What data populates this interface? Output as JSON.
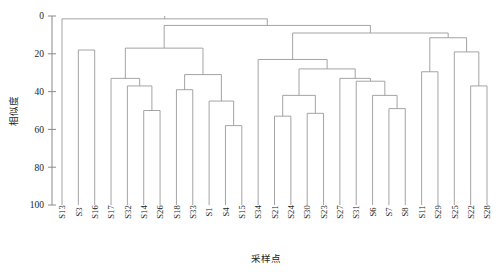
{
  "chart_data": {
    "type": "dendrogram",
    "title": "",
    "xlabel": "采样点",
    "ylabel": "相似度",
    "ylim": [
      0,
      100
    ],
    "y_inverted": true,
    "grid": false,
    "legend": "none",
    "yticks": [
      0,
      20,
      40,
      60,
      80,
      100
    ],
    "ytick_labels": [
      "0",
      "20",
      "40",
      "60",
      "80",
      "100"
    ],
    "leaves": [
      "S13",
      "S3",
      "S16",
      "S17",
      "S32",
      "S14",
      "S26",
      "S18",
      "S33",
      "S1",
      "S4",
      "S15",
      "S34",
      "S21",
      "S24",
      "S30",
      "S23",
      "S27",
      "S31",
      "S6",
      "S7",
      "S8",
      "S11",
      "S29",
      "S25",
      "S22",
      "S28"
    ],
    "leaf_count": 27,
    "merges": [
      {
        "id": "m1",
        "left": "S3",
        "right": "S16",
        "height": 18.0
      },
      {
        "id": "m2",
        "left": "S14",
        "right": "S26",
        "height": 50.0
      },
      {
        "id": "m3",
        "left": "S32",
        "right": "m2",
        "height": 37.0
      },
      {
        "id": "m4",
        "left": "S17",
        "right": "m3",
        "height": 33.0
      },
      {
        "id": "m5",
        "left": "S4",
        "right": "S15",
        "height": 58.0
      },
      {
        "id": "m6",
        "left": "S1",
        "right": "m5",
        "height": 45.0
      },
      {
        "id": "m7",
        "left": "S18",
        "right": "S33",
        "height": 39.0
      },
      {
        "id": "m8",
        "left": "m7",
        "right": "m6",
        "height": 31.0
      },
      {
        "id": "m9",
        "left": "m4",
        "right": "m8",
        "height": 17.0
      },
      {
        "id": "m10",
        "left": "S21",
        "right": "S24",
        "height": 53.0
      },
      {
        "id": "m11",
        "left": "S30",
        "right": "S23",
        "height": 51.5
      },
      {
        "id": "m12",
        "left": "m10",
        "right": "m11",
        "height": 42.0
      },
      {
        "id": "m13",
        "left": "S7",
        "right": "S8",
        "height": 49.0
      },
      {
        "id": "m14",
        "left": "S6",
        "right": "m13",
        "height": 42.0
      },
      {
        "id": "m15",
        "left": "S31",
        "right": "m14",
        "height": 34.5
      },
      {
        "id": "m16",
        "left": "S27",
        "right": "m15",
        "height": 33.0
      },
      {
        "id": "m17",
        "left": "m12",
        "right": "m16",
        "height": 28.0
      },
      {
        "id": "m18",
        "left": "S34",
        "right": "m17",
        "height": 23.0
      },
      {
        "id": "m19",
        "left": "S11",
        "right": "S29",
        "height": 29.5
      },
      {
        "id": "m20",
        "left": "S22",
        "right": "S28",
        "height": 37.0
      },
      {
        "id": "m21",
        "left": "S25",
        "right": "m20",
        "height": 19.0
      },
      {
        "id": "m22",
        "left": "m19",
        "right": "m21",
        "height": 11.5
      },
      {
        "id": "m23",
        "left": "m18",
        "right": "m22",
        "height": 9.0
      },
      {
        "id": "m24",
        "left": "m9",
        "right": "m23",
        "height": 5.0
      },
      {
        "id": "m25",
        "left": "S13",
        "right": "m24",
        "height": 1.5
      }
    ]
  }
}
